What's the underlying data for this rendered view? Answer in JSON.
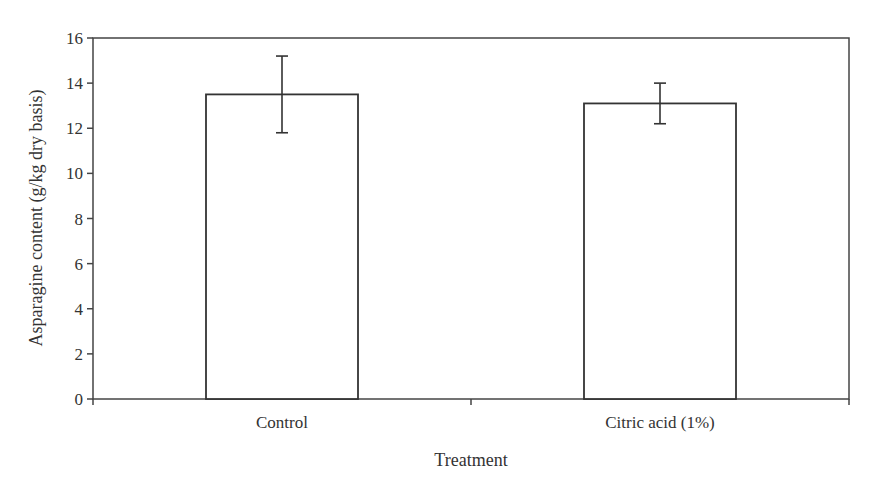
{
  "chart_data": {
    "type": "bar",
    "title": "",
    "xlabel": "Treatment",
    "ylabel": "Asparagine content (g/kg dry basis)",
    "categories": [
      "Control",
      "Citric acid (1%)"
    ],
    "values": [
      13.5,
      13.1
    ],
    "error_bars": [
      {
        "category": "Control",
        "lower": 11.8,
        "upper": 15.2
      },
      {
        "category": "Citric acid (1%)",
        "lower": 12.2,
        "upper": 14.0
      }
    ],
    "ylim": [
      0,
      16
    ],
    "yticks": [
      0,
      2,
      4,
      6,
      8,
      10,
      12,
      14,
      16
    ],
    "grid": false,
    "legend": null,
    "bar_fill": "#ffffff",
    "bar_stroke": "#333333"
  }
}
